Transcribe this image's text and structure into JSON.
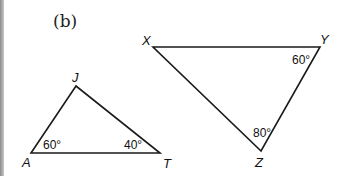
{
  "figure": {
    "label": "(b)"
  },
  "triangles": [
    {
      "name": "JAT",
      "vertices": [
        {
          "name": "J",
          "x": 76,
          "y": 86,
          "label_x": 72,
          "label_y": 82
        },
        {
          "name": "A",
          "x": 31,
          "y": 153,
          "label_x": 22,
          "label_y": 167
        },
        {
          "name": "T",
          "x": 160,
          "y": 153,
          "label_x": 163,
          "label_y": 168
        }
      ],
      "angles": [
        {
          "vertex": "A",
          "value": "60°",
          "x": 43,
          "y": 149
        },
        {
          "vertex": "T",
          "value": "40°",
          "x": 124,
          "y": 149
        }
      ]
    },
    {
      "name": "XYZ",
      "vertices": [
        {
          "name": "X",
          "x": 153,
          "y": 47,
          "label_x": 142,
          "label_y": 45
        },
        {
          "name": "Y",
          "x": 320,
          "y": 47,
          "label_x": 320,
          "label_y": 44
        },
        {
          "name": "Z",
          "x": 261,
          "y": 151,
          "label_x": 255,
          "label_y": 167
        }
      ],
      "angles": [
        {
          "vertex": "Y",
          "value": "60°",
          "x": 292,
          "y": 64
        },
        {
          "vertex": "Z",
          "value": "80°",
          "x": 253,
          "y": 137
        }
      ]
    }
  ],
  "colors": {
    "stroke": "#1a1a1a",
    "background": "#ffffff"
  }
}
